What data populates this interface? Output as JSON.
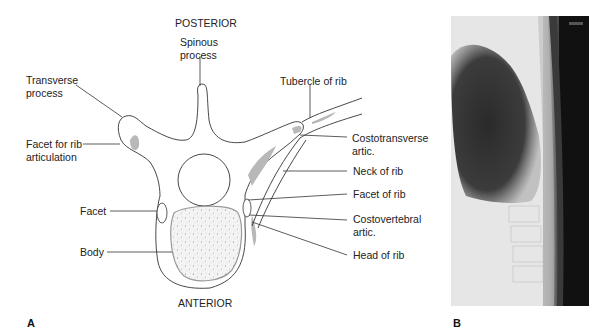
{
  "panel_a": {
    "letter": "A",
    "orientation_top": "POSTERIOR",
    "orientation_bottom": "ANTERIOR",
    "labels": {
      "spinous_process": "Spinous\nprocess",
      "transverse_process": "Transverse\nprocess",
      "facet_for_rib": "Facet for rib\narticulation",
      "tubercle_of_rib": "Tubercle of rib",
      "costotransverse": "Costotransverse\nartic.",
      "neck_of_rib": "Neck of rib",
      "facet_of_rib": "Facet of rib",
      "costovertebral": "Costovertebral\nartic.",
      "head_of_rib": "Head of rib",
      "facet": "Facet",
      "body": "Body"
    }
  },
  "panel_b": {
    "letter": "B",
    "image": "lateral-thoracic-spine-radiograph"
  },
  "colors": {
    "line": "#333333",
    "cartilage_gray": "#b5b5b5",
    "body_fill": "#f2f2f2",
    "xray_dark": "#101010",
    "xray_light": "#ececec"
  }
}
